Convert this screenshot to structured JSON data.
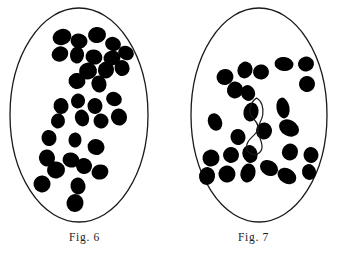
{
  "plate": {
    "background_color": "#ffffff",
    "ink_color": "#000000",
    "outline_color": "#1a1a1a",
    "width": 338,
    "height": 256
  },
  "figures": [
    {
      "id": "figure-6",
      "caption": "Fig. 6",
      "cell_outline": {
        "shape": "ellipse",
        "cx": 79,
        "cy": 115,
        "rx": 69,
        "ry": 107,
        "stroke_width": 1.3
      },
      "chromosome_fill": "#000000",
      "chromosome_count": 33,
      "arrangement": "diagonal scattered band from upper-right to lower-left",
      "chromosomes": [
        {
          "cx": 62,
          "cy": 37,
          "rx": 9.5,
          "ry": 8.0,
          "rot": -18
        },
        {
          "cx": 79,
          "cy": 41,
          "rx": 8.5,
          "ry": 7.5,
          "rot": 12
        },
        {
          "cx": 97,
          "cy": 35,
          "rx": 9.0,
          "ry": 8.0,
          "rot": -8
        },
        {
          "cx": 113,
          "cy": 44,
          "rx": 8.0,
          "ry": 7.0,
          "rot": 20
        },
        {
          "cx": 60,
          "cy": 54,
          "rx": 8.5,
          "ry": 7.5,
          "rot": -25
        },
        {
          "cx": 77,
          "cy": 55,
          "rx": 7.0,
          "ry": 8.5,
          "rot": 8
        },
        {
          "cx": 94,
          "cy": 57,
          "rx": 8.5,
          "ry": 7.5,
          "rot": 15
        },
        {
          "cx": 112,
          "cy": 58,
          "rx": 8.5,
          "ry": 7.5,
          "rot": -12
        },
        {
          "cx": 126,
          "cy": 53,
          "rx": 8.0,
          "ry": 7.0,
          "rot": 25
        },
        {
          "cx": 88,
          "cy": 71,
          "rx": 9.0,
          "ry": 8.5,
          "rot": -10
        },
        {
          "cx": 106,
          "cy": 70,
          "rx": 8.0,
          "ry": 8.5,
          "rot": 18
        },
        {
          "cx": 122,
          "cy": 68,
          "rx": 7.5,
          "ry": 8.0,
          "rot": -20
        },
        {
          "cx": 77,
          "cy": 81,
          "rx": 8.5,
          "ry": 8.0,
          "rot": 10
        },
        {
          "cx": 99,
          "cy": 84,
          "rx": 7.5,
          "ry": 8.5,
          "rot": -15
        },
        {
          "cx": 61,
          "cy": 106,
          "rx": 7.5,
          "ry": 8.0,
          "rot": -12
        },
        {
          "cx": 78,
          "cy": 101,
          "rx": 7.0,
          "ry": 7.5,
          "rot": 14
        },
        {
          "cx": 95,
          "cy": 106,
          "rx": 7.5,
          "ry": 8.0,
          "rot": -6
        },
        {
          "cx": 114,
          "cy": 99,
          "rx": 8.0,
          "ry": 7.0,
          "rot": 22
        },
        {
          "cx": 58,
          "cy": 121,
          "rx": 7.0,
          "ry": 7.5,
          "rot": 10
        },
        {
          "cx": 82,
          "cy": 118,
          "rx": 7.0,
          "ry": 8.5,
          "rot": -18
        },
        {
          "cx": 101,
          "cy": 121,
          "rx": 7.5,
          "ry": 7.5,
          "rot": 12
        },
        {
          "cx": 119,
          "cy": 117,
          "rx": 8.0,
          "ry": 8.5,
          "rot": -22
        },
        {
          "cx": 49,
          "cy": 138,
          "rx": 7.5,
          "ry": 8.0,
          "rot": -10
        },
        {
          "cx": 75,
          "cy": 140,
          "rx": 6.5,
          "ry": 7.5,
          "rot": 8
        },
        {
          "cx": 96,
          "cy": 147,
          "rx": 8.5,
          "ry": 8.0,
          "rot": 18
        },
        {
          "cx": 47,
          "cy": 158,
          "rx": 8.0,
          "ry": 8.5,
          "rot": -14
        },
        {
          "cx": 71,
          "cy": 160,
          "rx": 8.5,
          "ry": 7.5,
          "rot": 16
        },
        {
          "cx": 56,
          "cy": 170,
          "rx": 9.0,
          "ry": 8.5,
          "rot": -8
        },
        {
          "cx": 84,
          "cy": 166,
          "rx": 8.0,
          "ry": 8.0,
          "rot": 12
        },
        {
          "cx": 100,
          "cy": 172,
          "rx": 8.5,
          "ry": 7.5,
          "rot": -18
        },
        {
          "cx": 42,
          "cy": 184,
          "rx": 8.5,
          "ry": 8.5,
          "rot": 6
        },
        {
          "cx": 78,
          "cy": 186,
          "rx": 7.5,
          "ry": 8.5,
          "rot": -12
        },
        {
          "cx": 75,
          "cy": 203,
          "rx": 8.5,
          "ry": 9.0,
          "rot": 10
        }
      ]
    },
    {
      "id": "figure-7",
      "caption": "Fig. 7",
      "cell_outline": {
        "shape": "ellipse",
        "cx": 90,
        "cy": 115,
        "rx": 68,
        "ry": 107,
        "stroke_width": 1.3
      },
      "chromosome_fill": "#000000",
      "chromosome_count": 22,
      "arrangement": "two metaphase plate groups separated by an unstained figure-eight bivalent loop",
      "upper_group": [
        {
          "cx": 56,
          "cy": 77,
          "rx": 8.5,
          "ry": 8.0,
          "rot": -14
        },
        {
          "cx": 76,
          "cy": 70,
          "rx": 7.5,
          "ry": 8.5,
          "rot": 18
        },
        {
          "cx": 92,
          "cy": 72,
          "rx": 8.0,
          "ry": 7.5,
          "rot": -8
        },
        {
          "cx": 115,
          "cy": 64,
          "rx": 9.5,
          "ry": 7.0,
          "rot": 8
        },
        {
          "cx": 137,
          "cy": 64,
          "rx": 8.0,
          "ry": 7.5,
          "rot": -12
        },
        {
          "cx": 66,
          "cy": 90,
          "rx": 8.0,
          "ry": 8.5,
          "rot": 12
        },
        {
          "cx": 138,
          "cy": 84,
          "rx": 8.0,
          "ry": 8.0,
          "rot": 16
        },
        {
          "cx": 79,
          "cy": 93,
          "rx": 7.0,
          "ry": 8.0,
          "rot": -20
        }
      ],
      "middle_group": [
        {
          "cx": 46,
          "cy": 122,
          "rx": 7.0,
          "ry": 9.0,
          "rot": -22
        },
        {
          "cx": 82,
          "cy": 112,
          "rx": 7.5,
          "ry": 9.5,
          "rot": 14
        },
        {
          "cx": 114,
          "cy": 108,
          "rx": 6.5,
          "ry": 10.5,
          "rot": -10
        },
        {
          "cx": 120,
          "cy": 128,
          "rx": 10.5,
          "ry": 8.0,
          "rot": 28
        },
        {
          "cx": 95,
          "cy": 131,
          "rx": 8.0,
          "ry": 8.5,
          "rot": 8
        },
        {
          "cx": 69,
          "cy": 137,
          "rx": 7.5,
          "ry": 8.0,
          "rot": -16
        }
      ],
      "lower_group": [
        {
          "cx": 42,
          "cy": 158,
          "rx": 8.5,
          "ry": 8.5,
          "rot": -10
        },
        {
          "cx": 62,
          "cy": 155,
          "rx": 8.0,
          "ry": 8.0,
          "rot": 14
        },
        {
          "cx": 81,
          "cy": 154,
          "rx": 7.5,
          "ry": 9.0,
          "rot": -18
        },
        {
          "cx": 121,
          "cy": 152,
          "rx": 8.0,
          "ry": 8.5,
          "rot": 20
        },
        {
          "cx": 142,
          "cy": 155,
          "rx": 7.5,
          "ry": 8.0,
          "rot": -8
        },
        {
          "cx": 38,
          "cy": 176,
          "rx": 8.0,
          "ry": 9.0,
          "rot": 10
        },
        {
          "cx": 58,
          "cy": 174,
          "rx": 8.5,
          "ry": 8.5,
          "rot": -14
        },
        {
          "cx": 79,
          "cy": 173,
          "rx": 7.5,
          "ry": 9.5,
          "rot": 16
        },
        {
          "cx": 100,
          "cy": 168,
          "rx": 9.5,
          "ry": 7.5,
          "rot": 30
        },
        {
          "cx": 118,
          "cy": 176,
          "rx": 10.0,
          "ry": 7.5,
          "rot": 32
        },
        {
          "cx": 140,
          "cy": 172,
          "rx": 7.0,
          "ry": 8.0,
          "rot": -12
        }
      ],
      "unstained_loop": {
        "label": "figure-eight-bivalent",
        "fill": "none",
        "stroke": "#1a1a1a",
        "stroke_width": 1.2,
        "description": "open outlined figure-eight chromosome thread at centre of cell"
      }
    }
  ]
}
